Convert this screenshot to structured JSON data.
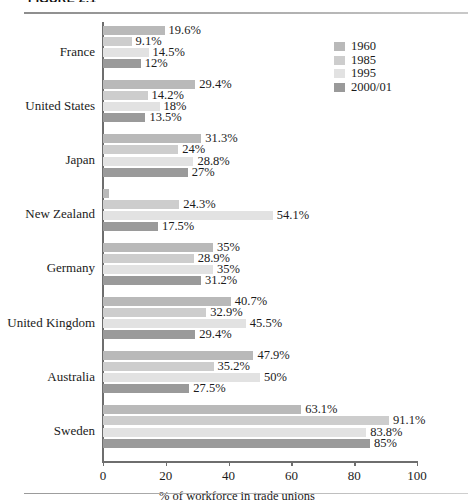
{
  "figure": {
    "caption": "FIGURE 2.1",
    "caption_clipped": true
  },
  "legend": {
    "position": "top-right",
    "items": [
      {
        "label": "1960",
        "color": "#b9b9b9"
      },
      {
        "label": "1985",
        "color": "#cdcdcd"
      },
      {
        "label": "1995",
        "color": "#e2e2e2"
      },
      {
        "label": "2000/01",
        "color": "#9a9a9a"
      }
    ]
  },
  "axis": {
    "x_ticks": [
      "0",
      "20",
      "40",
      "60",
      "80",
      "100"
    ],
    "x_title": "% of workforce in trade unions"
  },
  "chart_data": {
    "type": "bar",
    "orientation": "horizontal",
    "title": "",
    "xlabel": "% of workforce in trade unions",
    "ylabel": "",
    "xlim": [
      0,
      100
    ],
    "xticks": [
      0,
      20,
      40,
      60,
      80,
      100
    ],
    "grid": false,
    "legend_position": "top-right",
    "categories": [
      "France",
      "United States",
      "Japan",
      "New Zealand",
      "Germany",
      "United Kingdom",
      "Australia",
      "Sweden"
    ],
    "series": [
      {
        "name": "1960",
        "color": "#b9b9b9",
        "values": [
          19.6,
          29.4,
          31.3,
          2.0,
          35,
          40.7,
          47.9,
          63.1
        ],
        "labels": [
          "19.6%",
          "29.4%",
          "31.3%",
          "",
          "35%",
          "40.7%",
          "47.9%",
          "63.1%"
        ]
      },
      {
        "name": "1985",
        "color": "#cdcdcd",
        "values": [
          9.1,
          14.2,
          24,
          24.3,
          28.9,
          32.9,
          35.2,
          91.1
        ],
        "labels": [
          "9.1%",
          "14.2%",
          "24%",
          "24.3%",
          "28.9%",
          "32.9%",
          "35.2%",
          "91.1%"
        ]
      },
      {
        "name": "1995",
        "color": "#e2e2e2",
        "values": [
          14.5,
          18,
          28.8,
          54.1,
          35,
          45.5,
          50,
          83.8
        ],
        "labels": [
          "14.5%",
          "18%",
          "28.8%",
          "54.1%",
          "35%",
          "45.5%",
          "50%",
          "83.8%"
        ]
      },
      {
        "name": "2000/01",
        "color": "#9a9a9a",
        "values": [
          12,
          13.5,
          27,
          17.5,
          31.2,
          29.4,
          27.5,
          85
        ],
        "labels": [
          "12%",
          "13.5%",
          "27%",
          "17.5%",
          "31.2%",
          "29.4%",
          "27.5%",
          "85%"
        ]
      }
    ]
  }
}
